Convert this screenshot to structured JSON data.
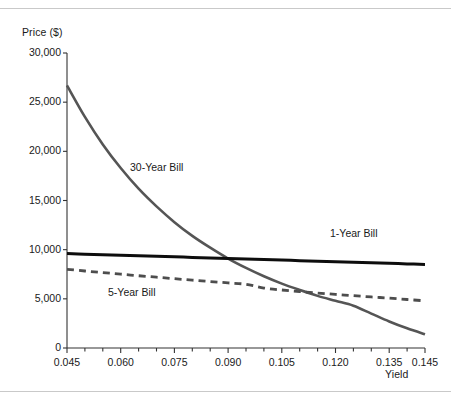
{
  "chart_data": {
    "type": "line",
    "title": "",
    "xlabel": "Yield",
    "ylabel": "Price ($)",
    "xlim": [
      0.045,
      0.145
    ],
    "ylim": [
      0,
      30000
    ],
    "grid": false,
    "legend_position": "inline-annotations",
    "ytick_labels": [
      "0",
      "5,000",
      "10,000",
      "15,000",
      "20,000",
      "25,000",
      "30,000"
    ],
    "ytick_values": [
      0,
      5000,
      10000,
      15000,
      20000,
      25000,
      30000
    ],
    "xtick_labels": [
      "0.045",
      "0.060",
      "0.075",
      "0.090",
      "0.105",
      "0.120",
      "0.135",
      "0.145"
    ],
    "xtick_values": [
      0.045,
      0.06,
      0.075,
      0.09,
      0.105,
      0.12,
      0.135,
      0.145
    ],
    "x_minor_step": 0.005,
    "x": [
      0.045,
      0.05,
      0.055,
      0.06,
      0.065,
      0.07,
      0.075,
      0.08,
      0.085,
      0.09,
      0.095,
      0.1,
      0.105,
      0.11,
      0.115,
      0.12,
      0.125,
      0.13,
      0.135,
      0.14,
      0.145
    ],
    "series": [
      {
        "name": "30-Year Bill",
        "style": "solid",
        "color": "#555555",
        "values": [
          26700,
          23500,
          20700,
          18300,
          16200,
          14400,
          12800,
          11400,
          10200,
          9100,
          8150,
          7300,
          6550,
          5900,
          5300,
          4800,
          4300,
          3500,
          2700,
          2000,
          1400
        ]
      },
      {
        "name": "1-Year Bill",
        "style": "solid",
        "color": "#0d0d0d",
        "values": [
          9600,
          9545,
          9490,
          9435,
          9380,
          9325,
          9270,
          9215,
          9160,
          9105,
          9050,
          8995,
          8940,
          8885,
          8830,
          8775,
          8720,
          8665,
          8610,
          8555,
          8500
        ]
      },
      {
        "name": "5-Year Bill",
        "style": "dashed",
        "color": "#4d4d4d",
        "values": [
          8000,
          7830,
          7670,
          7510,
          7350,
          7200,
          7050,
          6900,
          6760,
          6620,
          6480,
          6100,
          5900,
          5740,
          5590,
          5450,
          5320,
          5190,
          5070,
          4930,
          4800
        ]
      }
    ],
    "annotations": [
      {
        "text": "30-Year Bill",
        "x": 0.063,
        "y": 17600
      },
      {
        "text": "1-Year Bill",
        "x": 0.121,
        "y": 11300
      },
      {
        "text": "5-Year Bill",
        "x": 0.057,
        "y": 4900
      }
    ]
  }
}
